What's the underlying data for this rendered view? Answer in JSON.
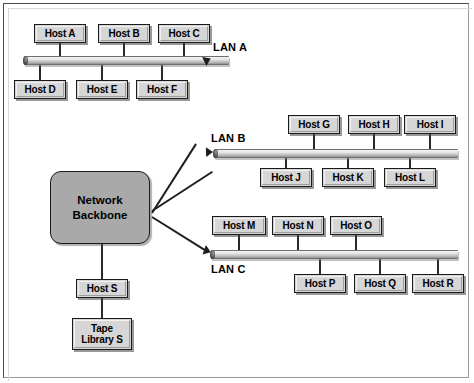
{
  "diagram": {
    "backbone": {
      "label": "Network\nBackbone",
      "fill": "#a9a9a9"
    },
    "colors": {
      "node_fill": "#d6d6d6",
      "node_border": "#1a1a1a",
      "bus_light": "#f4f4f4",
      "bus_dark": "#6e6e6e",
      "link": "#1e1e1e",
      "frame": "#4a4a4a",
      "background": "#ffffff"
    },
    "segments": [
      {
        "name": "lan-a",
        "label": "LAN A",
        "label_position": "above-right",
        "bus": {
          "x": 24,
          "y": 56,
          "width": 205
        },
        "hosts_above": [
          {
            "label": "Host A",
            "x": 34,
            "y": 24,
            "width": 52,
            "height": 19
          },
          {
            "label": "Host B",
            "x": 98,
            "y": 24,
            "width": 52,
            "height": 19
          },
          {
            "label": "Host C",
            "x": 158,
            "y": 24,
            "width": 52,
            "height": 19
          }
        ],
        "hosts_below": [
          {
            "label": "Host D",
            "x": 14,
            "y": 80,
            "width": 52,
            "height": 19
          },
          {
            "label": "Host E",
            "x": 76,
            "y": 80,
            "width": 52,
            "height": 19
          },
          {
            "label": "Host F",
            "x": 136,
            "y": 80,
            "width": 52,
            "height": 19
          }
        ]
      },
      {
        "name": "lan-b",
        "label": "LAN B",
        "label_position": "above-left",
        "bus": {
          "x": 214,
          "y": 149,
          "width": 244
        },
        "hosts_above": [
          {
            "label": "Host G",
            "x": 288,
            "y": 115,
            "width": 52,
            "height": 19
          },
          {
            "label": "Host H",
            "x": 348,
            "y": 115,
            "width": 52,
            "height": 19
          },
          {
            "label": "Host I",
            "x": 404,
            "y": 115,
            "width": 52,
            "height": 19
          }
        ],
        "hosts_below": [
          {
            "label": "Host J",
            "x": 260,
            "y": 168,
            "width": 52,
            "height": 19
          },
          {
            "label": "Host K",
            "x": 322,
            "y": 168,
            "width": 52,
            "height": 19
          },
          {
            "label": "Host L",
            "x": 384,
            "y": 168,
            "width": 52,
            "height": 19
          }
        ]
      },
      {
        "name": "lan-c",
        "label": "LAN C",
        "label_position": "below-left",
        "bus": {
          "x": 211,
          "y": 250,
          "width": 247
        },
        "hosts_above": [
          {
            "label": "Host M",
            "x": 212,
            "y": 216,
            "width": 54,
            "height": 19
          },
          {
            "label": "Host N",
            "x": 272,
            "y": 216,
            "width": 52,
            "height": 19
          },
          {
            "label": "Host O",
            "x": 330,
            "y": 216,
            "width": 52,
            "height": 19
          }
        ],
        "hosts_below": [
          {
            "label": "Host P",
            "x": 294,
            "y": 274,
            "width": 52,
            "height": 19
          },
          {
            "label": "Host Q",
            "x": 354,
            "y": 274,
            "width": 52,
            "height": 19
          },
          {
            "label": "Host R",
            "x": 412,
            "y": 274,
            "width": 52,
            "height": 19
          }
        ]
      }
    ],
    "storage_branch": {
      "host": {
        "label": "Host S",
        "x": 76,
        "y": 279,
        "width": 52,
        "height": 19
      },
      "library": {
        "label": "Tape\nLibrary S",
        "x": 72,
        "y": 318,
        "width": 60,
        "height": 32
      }
    }
  }
}
